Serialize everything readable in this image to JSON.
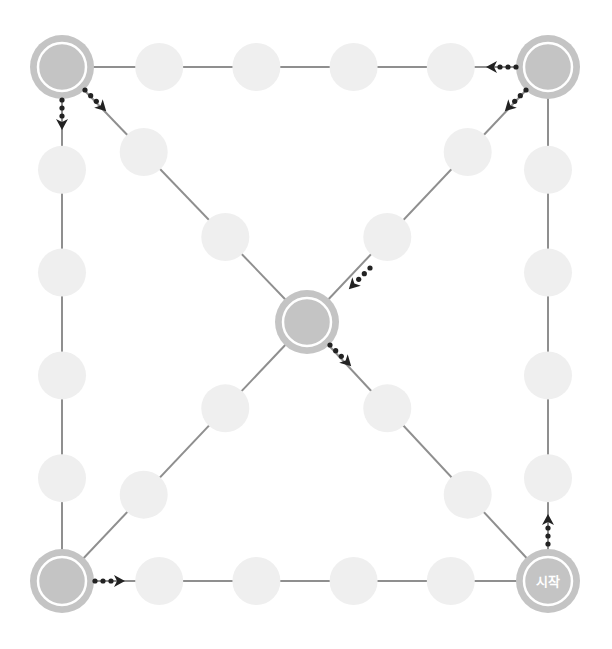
{
  "diagram": {
    "title": "",
    "start_label": "시작",
    "colors": {
      "edge": "#8f8f8f",
      "small_node": "#efefef",
      "major_node": "#c4c4c4",
      "arrow": "#222222"
    },
    "major_nodes": [
      {
        "id": "top-left",
        "label": ""
      },
      {
        "id": "top-right",
        "label": ""
      },
      {
        "id": "bottom-left",
        "label": ""
      },
      {
        "id": "bottom-right",
        "label": "시작"
      },
      {
        "id": "center",
        "label": ""
      }
    ],
    "paths": [
      {
        "id": "top-edge",
        "from": "top-left",
        "to": "top-right",
        "small_nodes": 4
      },
      {
        "id": "left-edge",
        "from": "top-left",
        "to": "bottom-left",
        "small_nodes": 4
      },
      {
        "id": "right-edge",
        "from": "top-right",
        "to": "bottom-right",
        "small_nodes": 4
      },
      {
        "id": "bottom-edge",
        "from": "bottom-left",
        "to": "bottom-right",
        "small_nodes": 4
      },
      {
        "id": "diag-tl-center",
        "from": "top-left",
        "to": "center",
        "small_nodes": 2
      },
      {
        "id": "diag-tr-center",
        "from": "top-right",
        "to": "center",
        "small_nodes": 2
      },
      {
        "id": "diag-center-bl",
        "from": "center",
        "to": "bottom-left",
        "small_nodes": 2
      },
      {
        "id": "diag-center-br",
        "from": "center",
        "to": "bottom-right",
        "small_nodes": 2
      }
    ],
    "direction_arrows": [
      {
        "at": "bottom-right",
        "toward": "up"
      },
      {
        "at": "top-right",
        "toward": "left"
      },
      {
        "at": "top-right",
        "toward": "center"
      },
      {
        "at": "top-left",
        "toward": "down"
      },
      {
        "at": "top-left",
        "toward": "center"
      },
      {
        "at": "center",
        "toward": "bottom-right"
      },
      {
        "at": "center",
        "toward": "bottom-left-incoming"
      },
      {
        "at": "bottom-left",
        "toward": "right"
      }
    ]
  }
}
